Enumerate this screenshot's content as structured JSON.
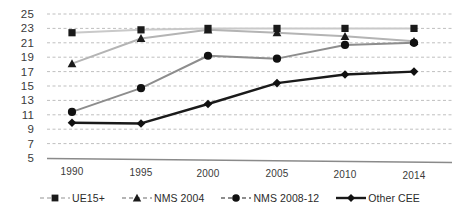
{
  "chart_data": {
    "type": "line",
    "title": "",
    "subtitle": "",
    "xlabel": "",
    "ylabel": "",
    "categories": [
      "1990",
      "1995",
      "2000",
      "2005",
      "2010",
      "2014"
    ],
    "x": [
      1990,
      1995,
      2000,
      2005,
      2010,
      2014
    ],
    "ylim": [
      5,
      25
    ],
    "ytick_labels": [
      "25",
      "23",
      "21",
      "19",
      "17",
      "15",
      "13",
      "11",
      "9",
      "7",
      "5"
    ],
    "yticks": [
      25,
      23,
      21,
      19,
      17,
      15,
      13,
      11,
      9,
      7,
      5
    ],
    "grid": true,
    "grid_style": "dashed-horizontal",
    "legend_position": "bottom",
    "series": [
      {
        "name": "UE15+",
        "marker": "square",
        "color": "#c9c9c9",
        "marker_color": "#1a1a1a",
        "values": [
          22.4,
          22.8,
          23.0,
          23.0,
          23.0,
          23.0
        ]
      },
      {
        "name": "NMS 2004",
        "marker": "triangle",
        "color": "#b4b4b4",
        "marker_color": "#1a1a1a",
        "values": [
          18.1,
          21.6,
          22.8,
          22.4,
          21.9,
          21.2
        ]
      },
      {
        "name": "NMS 2008-12",
        "marker": "circle",
        "color": "#8d8d8d",
        "marker_color": "#111111",
        "values": [
          11.4,
          14.7,
          19.2,
          18.8,
          20.7,
          21.0
        ]
      },
      {
        "name": "Other CEE",
        "marker": "diamond",
        "color": "#1a1a1a",
        "marker_color": "#111111",
        "values": [
          9.9,
          9.8,
          12.5,
          15.4,
          16.6,
          17.0
        ]
      }
    ]
  },
  "axes": {
    "y_labels": [
      "25",
      "23",
      "21",
      "19",
      "17",
      "15",
      "13",
      "11",
      "9",
      "7",
      "5"
    ],
    "x_labels": [
      "1990",
      "1995",
      "2000",
      "2005",
      "2010",
      "2014"
    ]
  },
  "legend": {
    "items": [
      {
        "label": "UE15+"
      },
      {
        "label": "NMS 2004"
      },
      {
        "label": "NMS 2008-12"
      },
      {
        "label": "Other CEE"
      }
    ]
  },
  "colors": {
    "grid": "#bfbfbf",
    "axis": "#8a8a8a",
    "text": "#3a3a3a"
  }
}
